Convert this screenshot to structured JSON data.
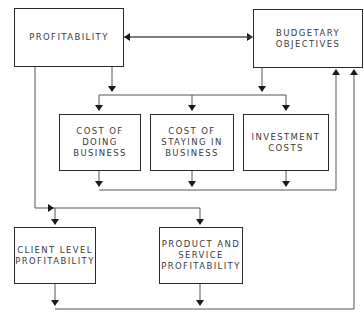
{
  "diagram": {
    "nodes": [
      {
        "id": "profitability",
        "label": "PROFITABILITY"
      },
      {
        "id": "budgetary",
        "label": "BUDGETARY\nOBJECTIVES"
      },
      {
        "id": "cost_doing",
        "label": "COST OF\nDOING\nBUSINESS"
      },
      {
        "id": "cost_staying",
        "label": "COST OF\nSTAYING IN\nBUSINESS"
      },
      {
        "id": "investment",
        "label": "INVESTMENT\nCOSTS"
      },
      {
        "id": "client",
        "label": "CLIENT LEVEL\nPROFITABILITY"
      },
      {
        "id": "product",
        "label": "PRODUCT AND\nSERVICE\nPROFITABILITY"
      }
    ],
    "edges": [
      {
        "from": "profitability",
        "to": "budgetary",
        "bidirectional": true
      },
      {
        "from": "profitability",
        "to": "cost_doing"
      },
      {
        "from": "profitability",
        "to": "cost_staying"
      },
      {
        "from": "profitability",
        "to": "investment"
      },
      {
        "from": "budgetary",
        "to": "cost_doing"
      },
      {
        "from": "budgetary",
        "to": "cost_staying"
      },
      {
        "from": "budgetary",
        "to": "investment"
      },
      {
        "from": "cost_doing",
        "to": "budgetary"
      },
      {
        "from": "cost_staying",
        "to": "budgetary"
      },
      {
        "from": "investment",
        "to": "budgetary"
      },
      {
        "from": "profitability",
        "to": "client"
      },
      {
        "from": "profitability",
        "to": "product"
      },
      {
        "from": "client",
        "to": "budgetary"
      },
      {
        "from": "product",
        "to": "budgetary"
      }
    ]
  }
}
